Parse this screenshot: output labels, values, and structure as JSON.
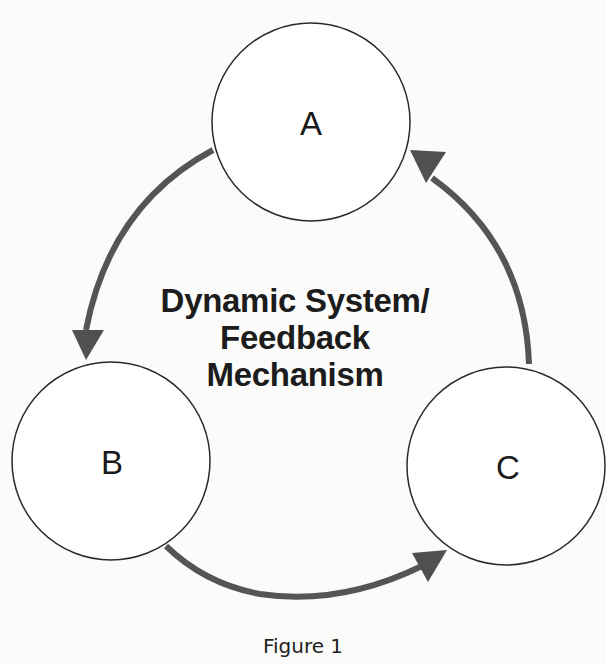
{
  "diagram": {
    "title_lines": [
      "Dynamic System/",
      "Feedback",
      "Mechanism"
    ],
    "caption": "Figure 1",
    "nodes": [
      {
        "id": "A",
        "label": "A",
        "cx": 311,
        "cy": 122,
        "r": 100
      },
      {
        "id": "B",
        "label": "B",
        "cx": 111,
        "cy": 461,
        "r": 100
      },
      {
        "id": "C",
        "label": "C",
        "cx": 506,
        "cy": 466,
        "r": 100
      }
    ],
    "edges": [
      {
        "from": "A",
        "to": "B",
        "direction": "A → B"
      },
      {
        "from": "B",
        "to": "C",
        "direction": "B → C"
      },
      {
        "from": "C",
        "to": "A",
        "direction": "C → A"
      }
    ],
    "colors": {
      "arrow": "#555555",
      "circle_stroke": "#2a2a2a",
      "text": "#1c1c1c",
      "background": "#fbfbfa"
    }
  }
}
